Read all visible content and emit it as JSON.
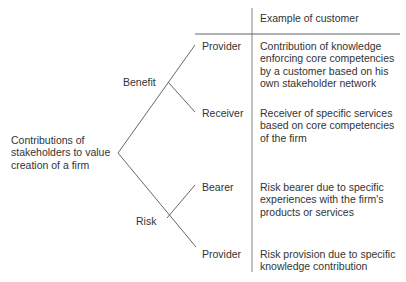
{
  "header": {
    "column_title": "Example of customer"
  },
  "root": {
    "label": "Contributions of\nstakeholders to value\ncreation of a firm"
  },
  "branches": [
    {
      "label": "Benefit",
      "leaves": [
        {
          "role": "Provider",
          "example": "Contribution of knowledge\nenforcing core competencies\nby a customer based on his\nown stakeholder network"
        },
        {
          "role": "Receiver",
          "example": "Receiver of specific services\nbased on core competencies\nof the firm"
        }
      ]
    },
    {
      "label": "Risk",
      "leaves": [
        {
          "role": "Bearer",
          "example": "Risk bearer due to specific\nexperiences with the firm's\nproducts or services"
        },
        {
          "role": "Provider",
          "example": "Risk provision due to specific\nknowledge contribution"
        }
      ]
    }
  ],
  "colors": {
    "line": "#555555",
    "text": "#333333",
    "background": "#ffffff"
  }
}
